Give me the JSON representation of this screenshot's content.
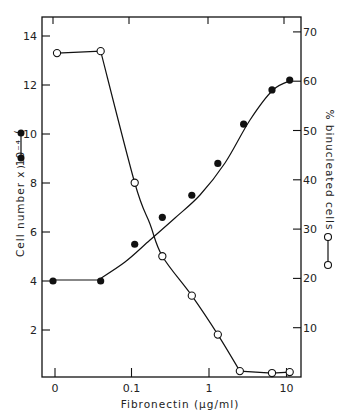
{
  "chart_data": {
    "type": "line",
    "title": "",
    "xlabel": "Fibronectin (µg/ml)",
    "ylabel": "Cell number x 10⁻⁴",
    "ylabel_right": "% binucleated cells",
    "x_scale": "log (with 0 break)",
    "x_ticks": [
      "0",
      "0.1",
      "1",
      "10"
    ],
    "y_ticks_left": [
      "2",
      "4",
      "6",
      "8",
      "10",
      "12",
      "14"
    ],
    "y_ticks_right": [
      "10",
      "20",
      "30",
      "40",
      "50",
      "60",
      "70"
    ],
    "ylim_left": [
      0,
      14.8
    ],
    "ylim_right": [
      0,
      74
    ],
    "grid": false,
    "legend": "inline axis-label markers: filled circle = cell number (left axis); open circle = % binucleated cells (right axis)",
    "x": [
      0,
      0.04,
      0.11,
      0.25,
      0.6,
      1.3,
      2.8,
      6.5,
      11
    ],
    "series": [
      {
        "name": "Cell number x 10^-4",
        "marker": "filled-circle",
        "axis": "left",
        "values": [
          4.0,
          4.0,
          5.5,
          6.6,
          7.5,
          8.8,
          10.4,
          11.8,
          12.2
        ]
      },
      {
        "name": "% binucleated cells",
        "marker": "open-circle",
        "axis": "right",
        "x": [
          0,
          0.04,
          0.11,
          0.25,
          0.6,
          1.3,
          2.5,
          6.5,
          11
        ],
        "values": [
          65.7,
          66.1,
          39.4,
          24.5,
          16.5,
          8.6,
          1.2,
          0.8,
          1.0
        ]
      }
    ]
  }
}
